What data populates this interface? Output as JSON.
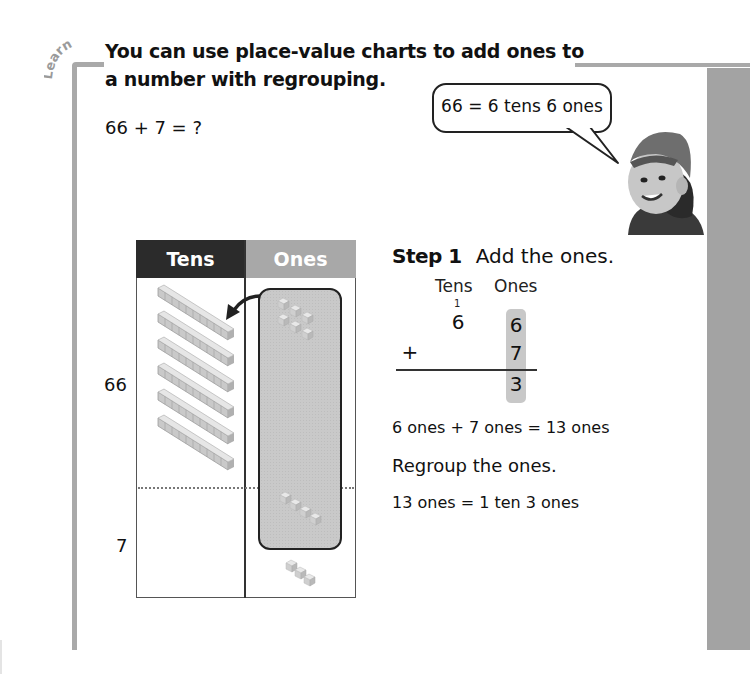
{
  "section_tab": {
    "label": "Learn"
  },
  "title": "You can use place-value charts to add ones to a number with regrouping.",
  "problem": "66 + 7 = ?",
  "speech_bubble": {
    "text": "66 = 6 tens 6 ones"
  },
  "illustration": {
    "subject": "boy-in-backwards-cap"
  },
  "place_value_chart": {
    "headers": {
      "tens": "Tens",
      "ones": "Ones"
    },
    "row_labels": {
      "first_addend": "66",
      "second_addend": "7"
    },
    "first_addend": {
      "tens_rods": 6,
      "ones_cubes": 6
    },
    "second_addend": {
      "tens_rods": 0,
      "ones_cubes": 7,
      "cubes_in_group": 4,
      "cubes_outside_group": 3
    },
    "regroup_arrow": "ones-to-tens"
  },
  "step1": {
    "label": "Step 1",
    "instruction": "Add the ones.",
    "columns": {
      "tens": "Tens",
      "ones": "Ones"
    },
    "carry": "1",
    "rows": [
      {
        "op": "",
        "tens": "6",
        "ones": "6"
      },
      {
        "op": "+",
        "tens": "",
        "ones": "7"
      }
    ],
    "result": {
      "tens": "",
      "ones": "3"
    },
    "equation": "6 ones + 7 ones = 13 ones",
    "regroup_heading": "Regroup the ones.",
    "regroup_equation": "13 ones = 1 ten 3 ones"
  },
  "colors": {
    "bracket_gray": "#a9a9a9",
    "tens_header": "#2b2b2b",
    "ones_header": "#a8a8a8",
    "side_strip": "#a3a3a3",
    "highlight": "#c8c8c8"
  }
}
